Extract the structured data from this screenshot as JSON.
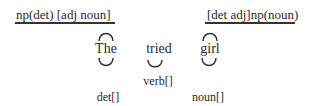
{
  "diagram": {
    "left_label": "np(det) [adj noun]",
    "right_label": "[det adj]np(noun)",
    "words": [
      {
        "text": "The",
        "category": "det[]"
      },
      {
        "text": "tried",
        "category": "verb[]"
      },
      {
        "text": "girl",
        "category": "noun[]"
      }
    ],
    "stroke_color": "#333333"
  }
}
